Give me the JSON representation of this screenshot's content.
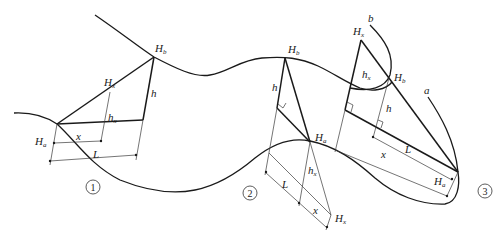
{
  "figure": {
    "type": "geometric diagram",
    "cases": [
      {
        "id": "1",
        "label": "1",
        "points": {
          "Ha": "H",
          "Ha_sub": "a",
          "Hb": "H",
          "Hb_sub": "b",
          "Hx": "H",
          "Hx_sub": "x"
        },
        "segments": {
          "h": "h",
          "hx": "h",
          "hx_sub": "x",
          "x": "x",
          "L": "L"
        }
      },
      {
        "id": "2",
        "label": "2",
        "points": {
          "Ha": "H",
          "Ha_sub": "a",
          "Hb": "H",
          "Hb_sub": "b",
          "Hx": "H",
          "Hx_sub": "x"
        },
        "segments": {
          "h": "h",
          "hx": "h",
          "hx_sub": "x",
          "x": "x",
          "L": "L"
        }
      },
      {
        "id": "3",
        "label": "3",
        "points": {
          "Ha": "H",
          "Ha_sub": "a",
          "Hb": "H",
          "Hb_sub": "b",
          "Hx": "H",
          "Hx_sub": "x"
        },
        "segments": {
          "h": "h",
          "hx": "h",
          "hx_sub": "x",
          "x": "x",
          "L": "L"
        },
        "curves": {
          "a": "a",
          "b": "b"
        }
      }
    ]
  }
}
